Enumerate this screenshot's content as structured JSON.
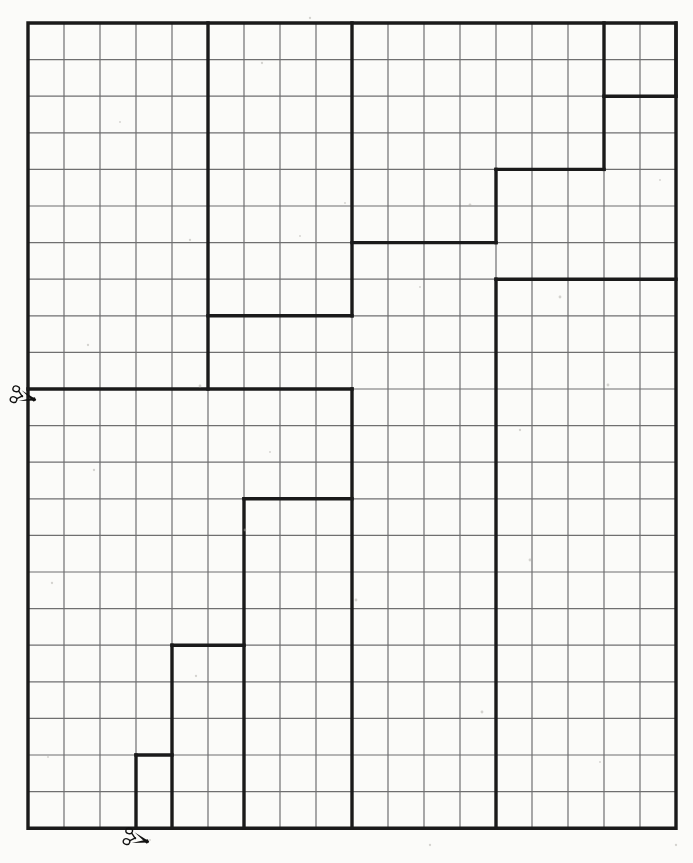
{
  "page": {
    "background_color": "#fbfbf9",
    "width": 693,
    "height": 863
  },
  "grid": {
    "origin_x": 28,
    "origin_y": 23,
    "cols": 18,
    "rows": 22,
    "cell_width": 36.0,
    "cell_height": 36.6,
    "thin_line_color": "#6f6f70",
    "thin_line_width": 1.2,
    "thick_line_color": "#1a1a1a",
    "thick_line_width": 3.4,
    "border_line_width": 3.4
  },
  "icons": {
    "scissors_left_label": "scissors-icon",
    "scissors_bottom_label": "scissors-icon",
    "scissors_color": "#111111"
  },
  "cut_lines": [
    {
      "name": "left-horizontal-cut",
      "description": "horizontal cut line across the sheet at row 10",
      "scissors_at": {
        "x": 22,
        "y": 396
      }
    },
    {
      "name": "bottom-vertical-cut",
      "description": "cut mark at the bottom edge near column 2",
      "scissors_at": {
        "x": 135,
        "y": 838
      }
    }
  ],
  "chart_data": {
    "type": "table",
    "xlabel": "",
    "ylabel": "",
    "grid_cols": 18,
    "grid_rows": 22,
    "thick_paths": [
      {
        "name": "outer-border",
        "closed": true,
        "points": [
          [
            0,
            0
          ],
          [
            18,
            0
          ],
          [
            18,
            22
          ],
          [
            0,
            22
          ]
        ]
      },
      {
        "name": "piece-a-vertical-col5",
        "closed": false,
        "points": [
          [
            5,
            0
          ],
          [
            5,
            10
          ]
        ]
      },
      {
        "name": "piece-a-horizontal-row10",
        "closed": false,
        "points": [
          [
            0,
            10
          ],
          [
            9,
            10
          ]
        ]
      },
      {
        "name": "piece-b-step",
        "closed": false,
        "points": [
          [
            5,
            8
          ],
          [
            9,
            8
          ]
        ]
      },
      {
        "name": "piece-c-vertical-col9-top",
        "closed": false,
        "points": [
          [
            9,
            0
          ],
          [
            9,
            8
          ]
        ]
      },
      {
        "name": "piece-d-step-upper",
        "closed": false,
        "points": [
          [
            9,
            6
          ],
          [
            13,
            6
          ]
        ]
      },
      {
        "name": "piece-e-vertical-col13",
        "closed": false,
        "points": [
          [
            13,
            4
          ],
          [
            13,
            6
          ]
        ]
      },
      {
        "name": "piece-e-horizontal-row4",
        "closed": false,
        "points": [
          [
            13,
            4
          ],
          [
            16,
            4
          ]
        ]
      },
      {
        "name": "piece-f-vertical-col16",
        "closed": false,
        "points": [
          [
            16,
            0
          ],
          [
            16,
            4
          ]
        ]
      },
      {
        "name": "piece-g-horizontal-row2",
        "closed": false,
        "points": [
          [
            16,
            2
          ],
          [
            18,
            2
          ]
        ]
      },
      {
        "name": "piece-h-vertical-col18-notch",
        "closed": false,
        "points": [
          [
            18,
            0
          ],
          [
            18,
            2
          ]
        ]
      },
      {
        "name": "piece-i-horizontal-row7",
        "closed": false,
        "points": [
          [
            13,
            7
          ],
          [
            18,
            7
          ]
        ]
      },
      {
        "name": "piece-i-vertical-col13-lower",
        "closed": false,
        "points": [
          [
            13,
            7
          ],
          [
            13,
            22
          ]
        ]
      },
      {
        "name": "piece-j-vertical-col9-lower",
        "closed": false,
        "points": [
          [
            9,
            10
          ],
          [
            9,
            22
          ]
        ]
      },
      {
        "name": "piece-k-horizontal-row13",
        "closed": false,
        "points": [
          [
            6,
            13
          ],
          [
            9,
            13
          ]
        ]
      },
      {
        "name": "piece-k-vertical-col6",
        "closed": false,
        "points": [
          [
            6,
            13
          ],
          [
            6,
            22
          ]
        ]
      },
      {
        "name": "piece-l-horizontal-row17",
        "closed": false,
        "points": [
          [
            4,
            17
          ],
          [
            6,
            17
          ]
        ]
      },
      {
        "name": "piece-l-vertical-col4",
        "closed": false,
        "points": [
          [
            4,
            17
          ],
          [
            4,
            22
          ]
        ]
      },
      {
        "name": "piece-m-horizontal-row20",
        "closed": false,
        "points": [
          [
            3,
            20
          ],
          [
            4,
            20
          ]
        ]
      },
      {
        "name": "piece-m-vertical-col3",
        "closed": false,
        "points": [
          [
            3,
            20
          ],
          [
            3,
            22
          ]
        ]
      }
    ]
  }
}
